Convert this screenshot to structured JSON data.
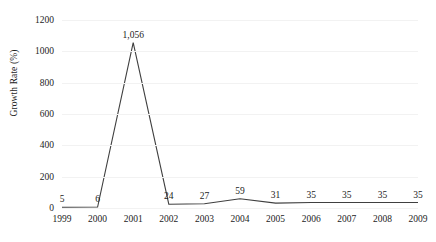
{
  "chart_data": {
    "type": "line",
    "title": "",
    "xlabel": "",
    "ylabel": "Growth Rate (%)",
    "categories": [
      "1999",
      "2000",
      "2001",
      "2002",
      "2003",
      "2004",
      "2005",
      "2006",
      "2007",
      "2008",
      "2009"
    ],
    "values": [
      5,
      6,
      1056,
      24,
      27,
      59,
      31,
      35,
      35,
      35,
      35
    ],
    "value_labels": [
      "5",
      "6",
      "1,056",
      "24",
      "27",
      "59",
      "31",
      "35",
      "35",
      "35",
      "35"
    ],
    "ylim": [
      0,
      1200
    ],
    "yticks": [
      0,
      200,
      400,
      600,
      800,
      1000,
      1200
    ],
    "ytick_labels": [
      "0",
      "200",
      "400",
      "600",
      "800",
      "1000",
      "1200"
    ],
    "grid": "horizontal-faint",
    "legend": "none",
    "series": [
      {
        "name": "Growth Rate (%)",
        "values": [
          5,
          6,
          1056,
          24,
          27,
          59,
          31,
          35,
          35,
          35,
          35
        ],
        "color": "#3f3f3f"
      }
    ],
    "colors": {
      "line": "#3f3f3f",
      "gridline": "#f2f2f2",
      "text": "#1c1c1c",
      "background": "#ffffff"
    }
  }
}
